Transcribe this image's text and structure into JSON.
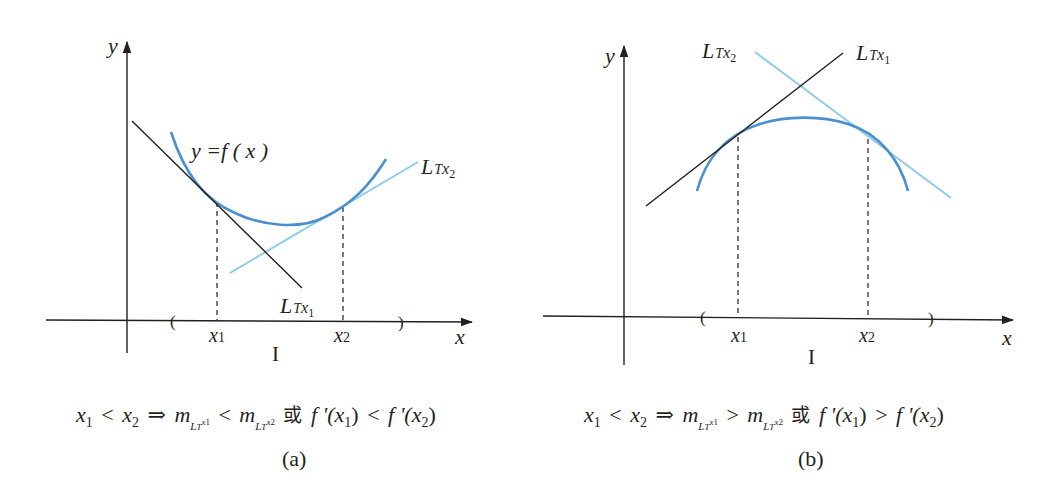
{
  "figure": {
    "panels": [
      {
        "id": "a",
        "tag": "(a)",
        "curve_label": "y =f ( x )",
        "axis_x_label": "x",
        "axis_y_label": "y",
        "interval_label": "I",
        "point1_label": "x",
        "point1_sub": "1",
        "point2_label": "x",
        "point2_sub": "2",
        "tangent1_label": {
          "L": "L",
          "T": "T",
          "x": "x",
          "sub": "1"
        },
        "tangent2_label": {
          "L": "L",
          "T": "T",
          "x": "x",
          "sub": "2"
        },
        "caption": {
          "x1": "x",
          "x1_sub": "1",
          "lt1": "<",
          "x2": "x",
          "x2_sub": "2",
          "implies": "⇒",
          "m1": "m",
          "m1_L": "L",
          "m1_T": "T",
          "m1_x": "x",
          "m1_sub": "1",
          "rel": "<",
          "m2": "m",
          "m2_L": "L",
          "m2_T": "T",
          "m2_x": "x",
          "m2_sub": "2",
          "or": "或",
          "fp1": "f '(",
          "fp1_x": "x",
          "fp1_sub": "1",
          "fp1_close": ")",
          "rel2": "<",
          "fp2": "f '(",
          "fp2_x": "x",
          "fp2_sub": "2",
          "fp2_close": ")"
        },
        "shape": "concave up"
      },
      {
        "id": "b",
        "tag": "(b)",
        "axis_x_label": "x",
        "axis_y_label": "y",
        "interval_label": "I",
        "point1_label": "x",
        "point1_sub": "1",
        "point2_label": "x",
        "point2_sub": "2",
        "tangent1_label": {
          "L": "L",
          "T": "T",
          "x": "x",
          "sub": "1"
        },
        "tangent2_label": {
          "L": "L",
          "T": "T",
          "x": "x",
          "sub": "2"
        },
        "caption": {
          "x1": "x",
          "x1_sub": "1",
          "lt1": "<",
          "x2": "x",
          "x2_sub": "2",
          "implies": "⇒",
          "m1": "m",
          "m1_L": "L",
          "m1_T": "T",
          "m1_x": "x",
          "m1_sub": "1",
          "rel": ">",
          "m2": "m",
          "m2_L": "L",
          "m2_T": "T",
          "m2_x": "x",
          "m2_sub": "2",
          "or": "或",
          "fp1": "f '(",
          "fp1_x": "x",
          "fp1_sub": "1",
          "fp1_close": ")",
          "rel2": ">",
          "fp2": "f '(",
          "fp2_x": "x",
          "fp2_sub": "2",
          "fp2_close": ")"
        },
        "shape": "concave down"
      }
    ],
    "colors": {
      "curve": "#4a90d0",
      "tangent_dark": "#231f20",
      "tangent_light": "#8fcbeb",
      "axis": "#231f20"
    }
  }
}
